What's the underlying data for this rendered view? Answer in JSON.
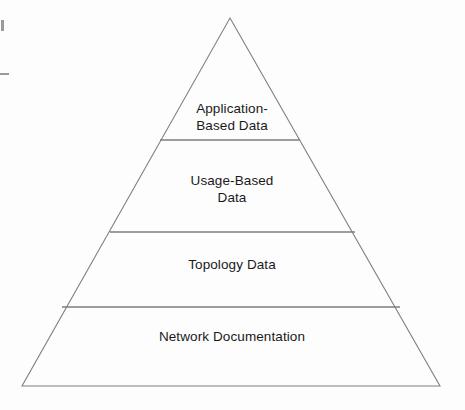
{
  "figure": {
    "name": "network-management-data-pyramid",
    "type": "pyramid-diagram",
    "background_color": "#fdfdfd",
    "stroke_color": "#808080",
    "text_color": "#1a1a1a"
  },
  "pyramid": {
    "apex": {
      "x": 230,
      "y": 18
    },
    "base_left": {
      "x": 22,
      "y": 386
    },
    "base_right": {
      "x": 440,
      "y": 386
    },
    "tiers": [
      {
        "id": "tier-application",
        "label": "Application-\nBased Data",
        "label_lines": [
          "Application-",
          "Based Data"
        ],
        "level": 1,
        "position": "top",
        "divider_y": 140,
        "divider_x_start": 160,
        "divider_x_end": 300
      },
      {
        "id": "tier-usage",
        "label": "Usage-Based\nData",
        "label_lines": [
          "Usage-Based",
          "Data"
        ],
        "level": 2,
        "position": "upper-middle",
        "divider_y": 232,
        "divider_x_start": 110,
        "divider_x_end": 355
      },
      {
        "id": "tier-topology",
        "label": "Topology Data",
        "label_lines": [
          "Topology Data"
        ],
        "level": 3,
        "position": "lower-middle",
        "divider_y": 307,
        "divider_x_start": 62,
        "divider_x_end": 400
      },
      {
        "id": "tier-network",
        "label": "Network Documentation",
        "label_lines": [
          "Network Documentation"
        ],
        "level": 4,
        "position": "bottom",
        "divider_y": null,
        "divider_x_start": null,
        "divider_x_end": null
      }
    ]
  },
  "artifacts": [
    {
      "id": "artifact-left-tick",
      "shape": "vertical-tick",
      "x": 1,
      "y": 20
    },
    {
      "id": "artifact-left-dash",
      "shape": "horizontal-dash",
      "x": 0,
      "y": 73
    }
  ]
}
